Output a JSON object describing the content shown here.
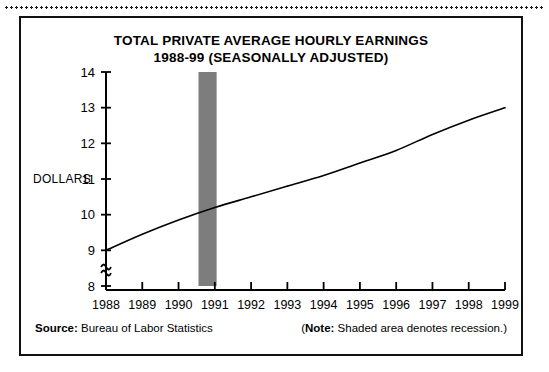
{
  "chart_data": {
    "type": "line",
    "title": "TOTAL PRIVATE AVERAGE HOURLY EARNINGS",
    "subtitle": "1988-99 (SEASONALLY ADJUSTED)",
    "xlabel": "",
    "ylabel": "DOLLARS",
    "ylim": [
      8,
      14
    ],
    "yticks": [
      8,
      9,
      10,
      11,
      12,
      13,
      14
    ],
    "ytick_labels": [
      "8",
      "9",
      "10",
      "11",
      "12",
      "13",
      "14"
    ],
    "axis_break": true,
    "axis_break_symbol": "≈",
    "grid": false,
    "legend": "none",
    "x": [
      1988,
      1989,
      1990,
      1991,
      1992,
      1993,
      1994,
      1995,
      1996,
      1997,
      1998,
      1999
    ],
    "xtick_labels": [
      "1988",
      "1989",
      "1990",
      "1991",
      "1992",
      "1993",
      "1994",
      "1995",
      "1996",
      "1997",
      "1998",
      "1999"
    ],
    "series": [
      {
        "name": "Total private average hourly earnings",
        "color": "#000000",
        "values": [
          9.0,
          9.45,
          9.85,
          10.2,
          10.5,
          10.8,
          11.1,
          11.45,
          11.8,
          12.25,
          12.65,
          13.0
        ]
      }
    ],
    "shaded_regions": [
      {
        "label": "recession",
        "x_start": 1990.55,
        "x_end": 1991.05,
        "color": "#7d7d7d"
      }
    ]
  },
  "footer": {
    "source_label": "Source:",
    "source_value": "Bureau of Labor Statistics",
    "note_open": "(",
    "note_label": "Note:",
    "note_value": "Shaded area denotes recession.)"
  }
}
